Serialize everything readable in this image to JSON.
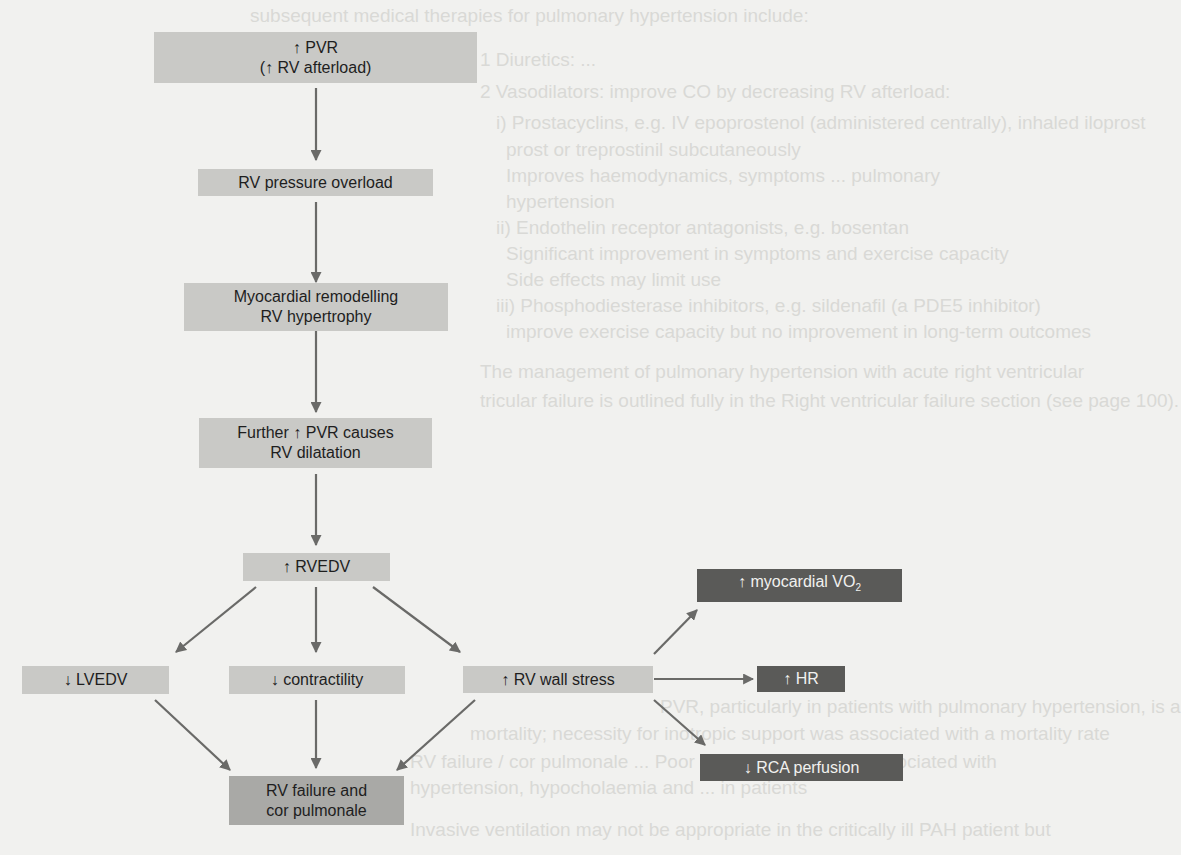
{
  "background_text": [
    {
      "text": "subsequent medical therapies for pulmonary hypertension include:",
      "x": 250,
      "y": 6
    },
    {
      "text": "1 Diuretics: ... ",
      "x": 480,
      "y": 50
    },
    {
      "text": "2 Vasodilators: improve CO by decreasing RV afterload:",
      "x": 480,
      "y": 82
    },
    {
      "text": "i) Prostacyclins, e.g. IV epoprostenol (administered centrally), inhaled iloprost",
      "x": 496,
      "y": 113
    },
    {
      "text": "prost or treprostinil subcutaneously",
      "x": 506,
      "y": 140
    },
    {
      "text": "Improves haemodynamics, symptoms ... pulmonary",
      "x": 506,
      "y": 166
    },
    {
      "text": "hypertension",
      "x": 506,
      "y": 192
    },
    {
      "text": "ii) Endothelin receptor antagonists, e.g. bosentan",
      "x": 496,
      "y": 218
    },
    {
      "text": "Significant improvement in symptoms and exercise capacity",
      "x": 506,
      "y": 244
    },
    {
      "text": "Side effects may limit use",
      "x": 506,
      "y": 270
    },
    {
      "text": "iii) Phosphodiesterase inhibitors, e.g. sildenafil (a PDE5 inhibitor)",
      "x": 496,
      "y": 296
    },
    {
      "text": "improve exercise capacity but no improvement in long-term outcomes",
      "x": 506,
      "y": 322
    },
    {
      "text": "The management of pulmonary hypertension with acute right ventricular",
      "x": 480,
      "y": 362
    },
    {
      "text": "tricular failure is outlined fully in the Right ventricular failure section (see page 100).",
      "x": 480,
      "y": 391
    },
    {
      "text": "PVR, particularly in patients with pulmonary hypertension, is a",
      "x": 660,
      "y": 697
    },
    {
      "text": "mortality; necessity for inotropic support was associated with a mortality rate",
      "x": 470,
      "y": 724
    },
    {
      "text": "RV failure / cor pulmonale ... Poor outcome measures associated with",
      "x": 410,
      "y": 752
    },
    {
      "text": "hypertension, hypocholaemia and ... in patients",
      "x": 410,
      "y": 778
    },
    {
      "text": "Invasive ventilation may not be appropriate in the critically ill PAH patient but",
      "x": 410,
      "y": 820
    }
  ],
  "diagram": {
    "nodes": {
      "pvr": {
        "line1": "↑ PVR",
        "line2": "(↑ RV afterload)"
      },
      "pressure_overload": {
        "label": "RV pressure overload"
      },
      "remodelling": {
        "line1": "Myocardial remodelling",
        "line2": "RV hypertrophy"
      },
      "dilatation": {
        "line1": "Further ↑ PVR causes",
        "line2": "RV dilatation"
      },
      "rvedv": {
        "label": "↑ RVEDV"
      },
      "lvedv": {
        "label": "↓ LVEDV"
      },
      "contractility": {
        "label": "↓ contractility"
      },
      "wall_stress": {
        "label": "↑ RV wall stress"
      },
      "vo2": {
        "label": "↑ myocardial VO",
        "subscript": "2"
      },
      "hr": {
        "label": "↑ HR"
      },
      "rca": {
        "label": "↓ RCA perfusion"
      },
      "failure": {
        "line1": "RV failure and",
        "line2": "cor pulmonale"
      }
    },
    "edges": [
      [
        "pvr",
        "pressure_overload"
      ],
      [
        "pressure_overload",
        "remodelling"
      ],
      [
        "remodelling",
        "dilatation"
      ],
      [
        "dilatation",
        "rvedv"
      ],
      [
        "rvedv",
        "lvedv"
      ],
      [
        "rvedv",
        "contractility"
      ],
      [
        "rvedv",
        "wall_stress"
      ],
      [
        "wall_stress",
        "vo2"
      ],
      [
        "wall_stress",
        "hr"
      ],
      [
        "wall_stress",
        "rca"
      ],
      [
        "lvedv",
        "failure"
      ],
      [
        "contractility",
        "failure"
      ],
      [
        "wall_stress",
        "failure"
      ]
    ],
    "colors": {
      "light_box": "#c9c9c6",
      "medium_box": "#a9a9a6",
      "dark_box": "#5a5a58",
      "arrow": "#6a6a68",
      "page": "#f1f1ef"
    }
  }
}
